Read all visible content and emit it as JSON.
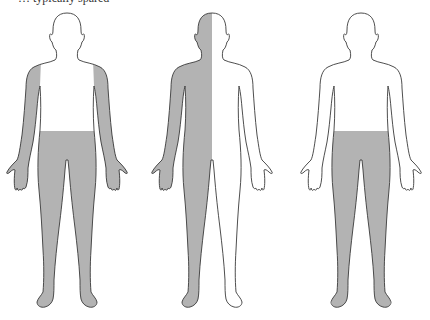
{
  "caption": "… typically spared",
  "colors": {
    "shade": "#b3b3b3",
    "outline": "#3a3a3a",
    "background": "#ffffff"
  },
  "figures": [
    {
      "id": "figure-1",
      "description": "Arms (outer upper arms through hands) and lower body below waist shaded",
      "shaded_regions": [
        "arms",
        "hands",
        "lower-body",
        "legs",
        "feet"
      ]
    },
    {
      "id": "figure-2",
      "description": "Right half of body (viewer's left) shaded — hemibody distribution",
      "shaded_regions": [
        "left-half-of-image"
      ]
    },
    {
      "id": "figure-3",
      "description": "Lower body below waist shaded, arms spared",
      "shaded_regions": [
        "lower-body",
        "legs",
        "feet"
      ]
    }
  ]
}
